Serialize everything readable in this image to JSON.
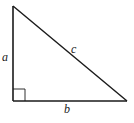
{
  "diagram": {
    "type": "right-triangle",
    "labels": {
      "a": "a",
      "b": "b",
      "c": "c"
    },
    "vertices": {
      "top": [
        13,
        6
      ],
      "bottom_left": [
        13,
        101
      ],
      "bottom_right": [
        127,
        101
      ]
    },
    "right_angle_marker": {
      "corner": "bottom_left",
      "size": 12
    },
    "colors": {
      "stroke": "#1a1a1a",
      "background": "#ffffff"
    }
  }
}
